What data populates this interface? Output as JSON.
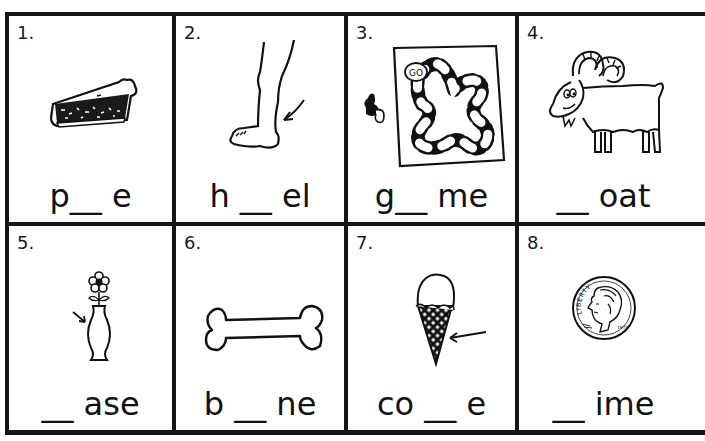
{
  "worksheet": {
    "instructions": "",
    "cells": [
      {
        "number": "1.",
        "word": "p__ e",
        "picture": "pie-slice",
        "missing_letter_position": "middle"
      },
      {
        "number": "2.",
        "word": "h __ el",
        "picture": "foot-heel",
        "missing_letter_position": "middle"
      },
      {
        "number": "3.",
        "word": "g__ me",
        "picture": "board-game",
        "missing_letter_position": "middle"
      },
      {
        "number": "4.",
        "word": "__ oat",
        "picture": "goat",
        "missing_letter_position": "start"
      },
      {
        "number": "5.",
        "word": "__ ase",
        "picture": "vase-with-flower",
        "missing_letter_position": "start"
      },
      {
        "number": "6.",
        "word": "b __ ne",
        "picture": "bone",
        "missing_letter_position": "middle"
      },
      {
        "number": "7.",
        "word": "co __ e",
        "picture": "ice-cream-cone",
        "missing_letter_position": "middle"
      },
      {
        "number": "8.",
        "word": "__ ime",
        "picture": "dime-coin",
        "missing_letter_position": "start"
      }
    ],
    "dime_text": {
      "motto": "LIBERTY",
      "year": "1979"
    },
    "game_board_text": "GO"
  },
  "colors": {
    "ink": "#151515",
    "paper": "#ffffff"
  }
}
